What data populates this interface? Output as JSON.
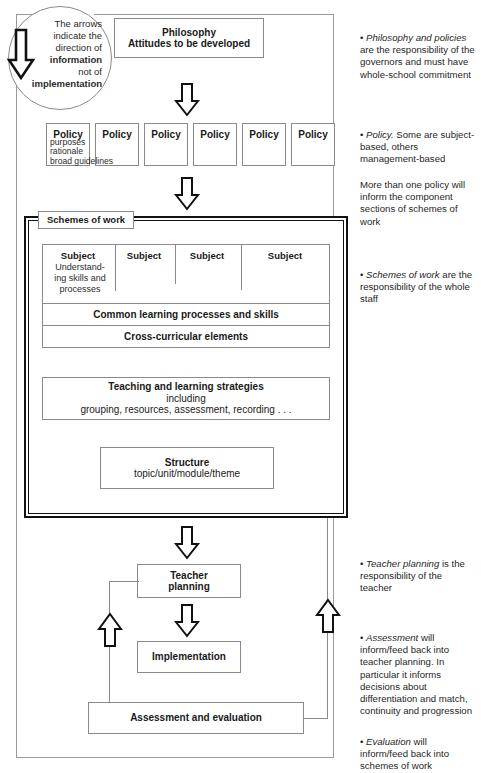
{
  "legend": {
    "line1": "The arrows",
    "line2": "indicate the",
    "line3": "direction of",
    "line4": "information",
    "line5": "not of",
    "line6": "implementation",
    "arrow_icon": "down-arrow-outline-icon"
  },
  "philosophy": {
    "title": "Philosophy",
    "subtitle": "Attitudes to be developed"
  },
  "policy": {
    "boxes": [
      {
        "label": "Policy"
      },
      {
        "label": "Policy"
      },
      {
        "label": "Policy"
      },
      {
        "label": "Policy"
      },
      {
        "label": "Policy"
      },
      {
        "label": "Policy"
      }
    ],
    "detail_line1": "purposes",
    "detail_line2": "rationale",
    "detail_line3": "broad guidelines"
  },
  "schemes": {
    "label": "Schemes of work",
    "subjects": [
      {
        "label": "Subject"
      },
      {
        "label": "Subject"
      },
      {
        "label": "Subject"
      },
      {
        "label": "Subject"
      }
    ],
    "subject_detail_line1": "Understand-",
    "subject_detail_line2": "ing skills and",
    "subject_detail_line3": "processes",
    "common_learning": "Common learning processes and skills",
    "cross_curricular": "Cross-curricular elements",
    "teaching_title": "Teaching and learning strategies",
    "teaching_line2": "including",
    "teaching_line3": "grouping, resources, assessment, recording . . .",
    "structure_title": "Structure",
    "structure_subtitle": "topic/unit/module/theme"
  },
  "flow": {
    "teacher_planning_line1": "Teacher",
    "teacher_planning_line2": "planning",
    "implementation": "Implementation",
    "assessment": "Assessment and evaluation"
  },
  "annotations": [
    {
      "id": "philosophy-and-policies",
      "bullet": "• ",
      "emphasis": "Philosophy and policies",
      "rest": " are the responsibility of the governors and must have whole-school commitment",
      "top": 18
    },
    {
      "id": "policy-subject-based",
      "bullet": "• ",
      "emphasis": "Policy.",
      "rest": " Some are subject-based, others management-based",
      "top": 115
    },
    {
      "id": "more-than-one-policy",
      "bullet": "",
      "emphasis": "",
      "rest": "More than one policy will inform the component sections of schemes of work",
      "top": 165
    },
    {
      "id": "schemes-of-work-responsibility",
      "bullet": "• ",
      "emphasis": "Schemes of work",
      "rest": " are the responsibility of the whole staff",
      "top": 255
    },
    {
      "id": "teacher-planning-responsibility",
      "bullet": "• ",
      "emphasis": "Teacher planning",
      "rest": " is the responsibility of the teacher",
      "top": 544
    },
    {
      "id": "assessment-feedback",
      "bullet": "• ",
      "emphasis": "Assessment",
      "rest": " will inform/feed back into teacher planning. In particular it informs decisions about differentiation and match, continuity and progression",
      "top": 618
    },
    {
      "id": "evaluation-feedback",
      "bullet": "• ",
      "emphasis": "Evaluation",
      "rest": " will inform/feed back into schemes of work",
      "top": 722
    }
  ],
  "colors": {
    "line": "#8a8a8a",
    "heavy_line": "#111111",
    "text": "#1a1a1a"
  }
}
